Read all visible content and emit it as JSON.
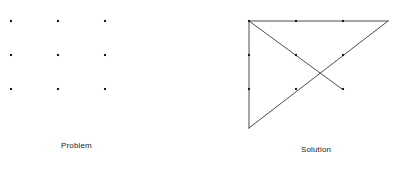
{
  "figure": {
    "background_color": "#ffffff",
    "ink_color": "#262626",
    "dot_color": "#1a1a1a",
    "line_color": "#3a3a3a",
    "line_width": 0.9,
    "dot_size": 2.1
  },
  "panels": [
    {
      "id": "problem",
      "caption": "Problem",
      "caption_x": 61,
      "caption_y": 141,
      "description": "Three by three grid of nine dots",
      "dots": [
        {
          "label": "top-left",
          "x": 11,
          "y": 21
        },
        {
          "label": "top-center",
          "x": 58,
          "y": 21
        },
        {
          "label": "top-right",
          "x": 105,
          "y": 21
        },
        {
          "label": "middle-left",
          "x": 11,
          "y": 55
        },
        {
          "label": "middle-center",
          "x": 58,
          "y": 55
        },
        {
          "label": "middle-right",
          "x": 105,
          "y": 55
        },
        {
          "label": "bottom-left",
          "x": 11,
          "y": 89
        },
        {
          "label": "bottom-center",
          "x": 58,
          "y": 89
        },
        {
          "label": "bottom-right",
          "x": 105,
          "y": 89
        }
      ]
    },
    {
      "id": "solution",
      "caption": "Solution",
      "caption_x": 301,
      "caption_y": 145,
      "description": "Four connected straight lines passing through all nine dots",
      "dots": [
        {
          "label": "top-left",
          "x": 249,
          "y": 21
        },
        {
          "label": "top-center",
          "x": 296,
          "y": 21
        },
        {
          "label": "top-right",
          "x": 343,
          "y": 21
        },
        {
          "label": "middle-left",
          "x": 249,
          "y": 55
        },
        {
          "label": "middle-center",
          "x": 296,
          "y": 55
        },
        {
          "label": "middle-right",
          "x": 343,
          "y": 55
        },
        {
          "label": "bottom-left",
          "x": 249,
          "y": 89
        },
        {
          "label": "bottom-center",
          "x": 296,
          "y": 89
        },
        {
          "label": "bottom-right",
          "x": 343,
          "y": 89
        }
      ],
      "path": [
        {
          "label": "start-top-left",
          "x": 249,
          "y": 21
        },
        {
          "label": "extend-past-top-right",
          "x": 388,
          "y": 21
        },
        {
          "label": "extend-past-bottom-left",
          "x": 249,
          "y": 128
        },
        {
          "label": "return-to-top-left",
          "x": 249,
          "y": 21
        },
        {
          "label": "diagonal-end-bottom-right",
          "x": 342,
          "y": 89
        }
      ],
      "segments": [
        {
          "name": "top-horizontal",
          "x1": 249,
          "y1": 21,
          "x2": 388,
          "y2": 21
        },
        {
          "name": "right-ascending-edge",
          "x1": 388,
          "y1": 21,
          "x2": 249,
          "y2": 128
        },
        {
          "name": "left-vertical",
          "x1": 249,
          "y1": 128,
          "x2": 249,
          "y2": 21
        },
        {
          "name": "main-diagonal",
          "x1": 249,
          "y1": 21,
          "x2": 342,
          "y2": 89
        }
      ]
    }
  ],
  "chart_data": {
    "type": "diagram",
    "subtitle": "Classic think-outside-the-box problem and its four-line solution",
    "panel_labels": [
      "Problem",
      "Solution"
    ],
    "grid_rows": 3,
    "grid_cols": 3,
    "dot_count": 9,
    "solution_line_count": 4
  }
}
